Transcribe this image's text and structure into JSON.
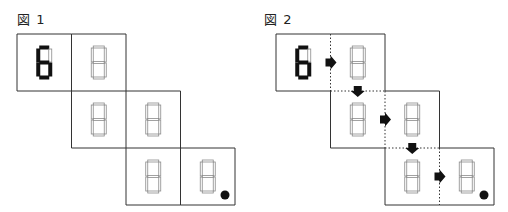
{
  "figures": [
    {
      "label": "図 1",
      "cells": [
        {
          "row": 0,
          "col": 0,
          "digit": "6",
          "lit": true
        },
        {
          "row": 0,
          "col": 1,
          "digit": "8",
          "lit": false
        },
        {
          "row": 1,
          "col": 1,
          "digit": "8",
          "lit": false
        },
        {
          "row": 1,
          "col": 2,
          "digit": "8",
          "lit": false
        },
        {
          "row": 2,
          "col": 2,
          "digit": "8",
          "lit": false
        },
        {
          "row": 2,
          "col": 3,
          "digit": "8",
          "lit": false,
          "goal_dot": true
        }
      ],
      "arrows": [],
      "dashed_dividers": false
    },
    {
      "label": "図 2",
      "cells": [
        {
          "row": 0,
          "col": 0,
          "digit": "6",
          "lit": true
        },
        {
          "row": 0,
          "col": 1,
          "digit": "8",
          "lit": false
        },
        {
          "row": 1,
          "col": 1,
          "digit": "8",
          "lit": false
        },
        {
          "row": 1,
          "col": 2,
          "digit": "8",
          "lit": false
        },
        {
          "row": 2,
          "col": 2,
          "digit": "8",
          "lit": false
        },
        {
          "row": 2,
          "col": 3,
          "digit": "8",
          "lit": false,
          "goal_dot": true
        }
      ],
      "arrows": [
        {
          "from": [
            0,
            0
          ],
          "to": [
            0,
            1
          ],
          "direction": "right"
        },
        {
          "from": [
            0,
            1
          ],
          "to": [
            1,
            1
          ],
          "direction": "down"
        },
        {
          "from": [
            1,
            1
          ],
          "to": [
            1,
            2
          ],
          "direction": "right"
        },
        {
          "from": [
            1,
            2
          ],
          "to": [
            2,
            2
          ],
          "direction": "down"
        },
        {
          "from": [
            2,
            2
          ],
          "to": [
            2,
            3
          ],
          "direction": "right"
        }
      ],
      "dashed_dividers": true
    }
  ],
  "colors": {
    "line": "#333333",
    "segment_on": "#111111",
    "segment_off": "#8a8a8a",
    "arrow": "#111111",
    "dot": "#111111"
  }
}
